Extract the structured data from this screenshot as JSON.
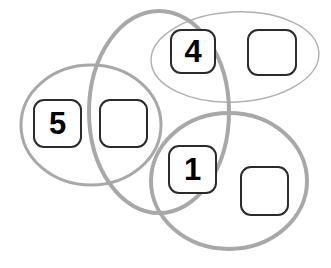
{
  "diagram": {
    "background_color": "#ffffff",
    "regions": [
      {
        "id": "ellipse-top",
        "shape": "ellipse",
        "cx": 235,
        "cy": 57,
        "rx": 84,
        "ry": 45,
        "rotation": -3,
        "stroke": "#b0b0b0",
        "stroke_width": 1.4,
        "fill": "none"
      },
      {
        "id": "circle-left",
        "shape": "ellipse",
        "cx": 91,
        "cy": 125,
        "rx": 70,
        "ry": 60,
        "rotation": 0,
        "stroke": "#a8a8a8",
        "stroke_width": 3,
        "fill": "none"
      },
      {
        "id": "circle-middle",
        "shape": "ellipse",
        "cx": 159,
        "cy": 112,
        "rx": 70,
        "ry": 101,
        "rotation": 0,
        "stroke": "#a8a8a8",
        "stroke_width": 4,
        "fill": "none"
      },
      {
        "id": "circle-bottom-right",
        "shape": "ellipse",
        "cx": 229,
        "cy": 181,
        "rx": 78,
        "ry": 68,
        "rotation": 0,
        "stroke": "#a8a8a8",
        "stroke_width": 4,
        "fill": "none"
      }
    ],
    "nodes": [
      {
        "id": "node-5",
        "label": "5",
        "x": 33,
        "y": 99,
        "width": 49,
        "height": 49
      },
      {
        "id": "node-empty-left",
        "label": "",
        "x": 99,
        "y": 99,
        "width": 49,
        "height": 49
      },
      {
        "id": "node-4",
        "label": "4",
        "x": 170,
        "y": 29,
        "width": 46,
        "height": 45
      },
      {
        "id": "node-empty-top-right",
        "label": "",
        "x": 247,
        "y": 29,
        "width": 50,
        "height": 47
      },
      {
        "id": "node-1",
        "label": "1",
        "x": 168,
        "y": 145,
        "width": 49,
        "height": 49
      },
      {
        "id": "node-empty-bottom-right",
        "label": "",
        "x": 240,
        "y": 166,
        "width": 49,
        "height": 50
      }
    ]
  }
}
